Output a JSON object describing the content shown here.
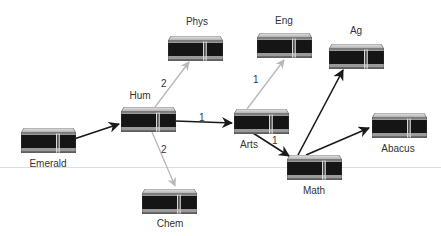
{
  "diagram": {
    "type": "network-routing-graph",
    "colors": {
      "primary_edge": "#1a1a1a",
      "secondary_edge": "#b8b8b8",
      "server_body": "#151515",
      "server_top": "#cfcfcf",
      "server_stripe": "#9a9a9a"
    },
    "nodes": [
      {
        "id": "emerald",
        "label": "Emerald",
        "x": 21,
        "y": 128,
        "label_x": 48,
        "label_y": 158
      },
      {
        "id": "hum",
        "label": "Hum",
        "x": 121,
        "y": 107,
        "label_x": 140,
        "label_y": 90
      },
      {
        "id": "phys",
        "label": "Phys",
        "x": 168,
        "y": 36,
        "label_x": 197,
        "label_y": 16
      },
      {
        "id": "chem",
        "label": "Chem",
        "x": 142,
        "y": 189,
        "label_x": 170,
        "label_y": 218
      },
      {
        "id": "eng",
        "label": "Eng",
        "x": 257,
        "y": 33,
        "label_x": 284,
        "label_y": 15
      },
      {
        "id": "arts",
        "label": "Arts",
        "x": 234,
        "y": 109,
        "label_x": 249,
        "label_y": 139
      },
      {
        "id": "ag",
        "label": "Ag",
        "x": 329,
        "y": 44,
        "label_x": 356,
        "label_y": 25
      },
      {
        "id": "math",
        "label": "Math",
        "x": 287,
        "y": 155,
        "label_x": 314,
        "label_y": 185
      },
      {
        "id": "abacus",
        "label": "Abacus",
        "x": 372,
        "y": 113,
        "label_x": 398,
        "label_y": 143
      }
    ],
    "edges": [
      {
        "from": "emerald",
        "to": "hum",
        "style": "primary",
        "x1": 74,
        "y1": 139,
        "x2": 119,
        "y2": 124,
        "weight": ""
      },
      {
        "from": "hum",
        "to": "phys",
        "style": "secondary",
        "x1": 155,
        "y1": 107,
        "x2": 189,
        "y2": 62,
        "weight": "2",
        "wx": 161,
        "wy": 78
      },
      {
        "from": "hum",
        "to": "chem",
        "style": "secondary",
        "x1": 152,
        "y1": 132,
        "x2": 175,
        "y2": 186,
        "weight": "2",
        "wx": 161,
        "wy": 144
      },
      {
        "from": "hum",
        "to": "arts",
        "style": "primary",
        "x1": 175,
        "y1": 121,
        "x2": 232,
        "y2": 123,
        "weight": "1",
        "wx": 199,
        "wy": 112
      },
      {
        "from": "arts",
        "to": "eng",
        "style": "secondary",
        "x1": 247,
        "y1": 109,
        "x2": 284,
        "y2": 60,
        "weight": "1",
        "wx": 253,
        "wy": 74
      },
      {
        "from": "arts",
        "to": "math",
        "style": "primary",
        "x1": 253,
        "y1": 133,
        "x2": 289,
        "y2": 156,
        "weight": "1",
        "wx": 272,
        "wy": 135
      },
      {
        "from": "math",
        "to": "ag",
        "style": "primary",
        "x1": 298,
        "y1": 155,
        "x2": 343,
        "y2": 70,
        "weight": ""
      },
      {
        "from": "math",
        "to": "abacus",
        "style": "primary",
        "x1": 306,
        "y1": 155,
        "x2": 369,
        "y2": 128,
        "weight": ""
      }
    ],
    "divider_y": 167
  }
}
